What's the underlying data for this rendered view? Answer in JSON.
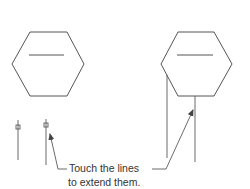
{
  "figure": {
    "caption_lines": [
      "Touch the lines",
      "to extend them."
    ],
    "colors": {
      "line": "#555555",
      "text": "#333333",
      "background": "#ffffff"
    },
    "left_panel": {
      "shape": "hexagon",
      "has_center_bar": true,
      "short_lines": 2,
      "has_snap_square_markers": true
    },
    "right_panel": {
      "shape": "hexagon",
      "has_center_bar": true,
      "extended_lines": 2
    },
    "arrows": [
      {
        "name": "left-arrow",
        "points_to": "left short line end marker"
      },
      {
        "name": "right-arrow",
        "points_to": "right extended line"
      }
    ]
  }
}
